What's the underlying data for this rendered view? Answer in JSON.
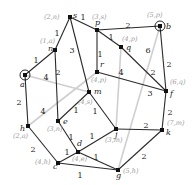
{
  "diagram": {
    "type": "weighted-graph-shortest-path",
    "nodes": [
      {
        "id": "s",
        "x": 70,
        "y": 17,
        "label": "(2,n)",
        "lx": 44,
        "ly": 19,
        "nx": 73,
        "ny": 18
      },
      {
        "id": "p",
        "x": 97,
        "y": 30,
        "label": "(3,s)",
        "lx": 92,
        "ly": 19,
        "nx": 95,
        "ny": 25
      },
      {
        "id": "b",
        "x": 160,
        "y": 26,
        "label": "(5,p)",
        "lx": 147,
        "ly": 17,
        "nx": 166,
        "ny": 29,
        "ring": true
      },
      {
        "id": "n",
        "x": 55,
        "y": 50,
        "label": "(1,a)",
        "lx": 40,
        "ly": 43,
        "nx": 48,
        "ny": 51
      },
      {
        "id": "q",
        "x": 121,
        "y": 47,
        "label": "(4,p)",
        "lx": 122,
        "ly": 41,
        "nx": 126,
        "ny": 50
      },
      {
        "id": "a",
        "x": 25,
        "y": 75,
        "label": "",
        "lx": 0,
        "ly": 0,
        "nx": 20,
        "ny": 87,
        "ring": true
      },
      {
        "id": "r",
        "x": 97,
        "y": 72,
        "label": "(4,p)",
        "lx": 91,
        "ly": 82,
        "nx": 100,
        "ny": 67
      },
      {
        "id": "m",
        "x": 89,
        "y": 92,
        "label": "(4,s)",
        "lx": 78,
        "ly": 104,
        "nx": 94,
        "ny": 94
      },
      {
        "id": "f",
        "x": 166,
        "y": 91,
        "label": "(6,q)",
        "lx": 170,
        "ly": 84,
        "nx": 170,
        "ny": 96
      },
      {
        "id": "e",
        "x": 58,
        "y": 121,
        "label": "(3,n)",
        "lx": 47,
        "ly": 131,
        "nx": 63,
        "ny": 124
      },
      {
        "id": "h",
        "x": 28,
        "y": 126,
        "label": "(2,a)",
        "lx": 13,
        "ly": 138,
        "nx": 20,
        "ny": 131
      },
      {
        "id": "j",
        "x": 116,
        "y": 129,
        "label": "(3,m)",
        "lx": 105,
        "ly": 142,
        "nx": 115,
        "ny": 137
      },
      {
        "id": "k",
        "x": 162,
        "y": 130,
        "label": "(7,m)",
        "lx": 167,
        "ly": 125,
        "nx": 166,
        "ny": 135
      },
      {
        "id": "d",
        "x": 78,
        "y": 152,
        "label": "(4,e)",
        "lx": 72,
        "ly": 161,
        "nx": 77,
        "ny": 146
      },
      {
        "id": "c",
        "x": 58,
        "y": 163,
        "label": "(4,h)",
        "lx": 35,
        "ly": 164,
        "nx": 53,
        "ny": 169
      },
      {
        "id": "g",
        "x": 118,
        "y": 170,
        "label": "(5,h)",
        "lx": 123,
        "ly": 173,
        "nx": 116,
        "ny": 178
      }
    ],
    "edges": [
      {
        "from": "s",
        "to": "p",
        "w": "1",
        "wx": 83,
        "wy": 17,
        "gray": false
      },
      {
        "from": "s",
        "to": "n",
        "w": "1",
        "wx": 57,
        "wy": 33,
        "gray": false
      },
      {
        "from": "s",
        "to": "m",
        "w": "3",
        "wx": 72,
        "wy": 50,
        "gray": false
      },
      {
        "from": "p",
        "to": "b",
        "w": "2",
        "wx": 128,
        "wy": 25,
        "gray": false
      },
      {
        "from": "p",
        "to": "q",
        "w": "1",
        "wx": 111,
        "wy": 37,
        "gray": false
      },
      {
        "from": "p",
        "to": "r",
        "w": "1",
        "wx": 100,
        "wy": 54,
        "gray": false
      },
      {
        "from": "q",
        "to": "f",
        "w": "2",
        "wx": 153,
        "wy": 72,
        "gray": false
      },
      {
        "from": "b",
        "to": "f",
        "w": "2",
        "wx": 169,
        "wy": 64,
        "gray": false
      },
      {
        "from": "r",
        "to": "f",
        "w": "3",
        "wx": 150,
        "wy": 93,
        "gray": false
      },
      {
        "from": "n",
        "to": "a",
        "w": "1",
        "wx": 36,
        "wy": 60,
        "gray": false
      },
      {
        "from": "n",
        "to": "e",
        "w": "2",
        "wx": 58,
        "wy": 72,
        "gray": false
      },
      {
        "from": "a",
        "to": "h",
        "w": "2",
        "wx": 19,
        "wy": 102,
        "gray": false
      },
      {
        "from": "m",
        "to": "e",
        "w": "1",
        "wx": 76,
        "wy": 110,
        "gray": false
      },
      {
        "from": "m",
        "to": "j",
        "w": "1",
        "wx": 95,
        "wy": 111,
        "gray": false
      },
      {
        "from": "e",
        "to": "d",
        "w": "1",
        "wx": 71,
        "wy": 137,
        "gray": false
      },
      {
        "from": "h",
        "to": "c",
        "w": "2",
        "wx": 33,
        "wy": 149,
        "gray": false
      },
      {
        "from": "d",
        "to": "j",
        "w": "1",
        "wx": 92,
        "wy": 136,
        "gray": false
      },
      {
        "from": "d",
        "to": "c",
        "w": "1",
        "wx": 67,
        "wy": 152,
        "gray": false
      },
      {
        "from": "d",
        "to": "g",
        "w": "1",
        "wx": 96,
        "wy": 157,
        "gray": false
      },
      {
        "from": "c",
        "to": "g",
        "w": "1",
        "wx": 80,
        "wy": 175,
        "gray": false
      },
      {
        "from": "j",
        "to": "k",
        "w": "2",
        "wx": 146,
        "wy": 125,
        "gray": false
      },
      {
        "from": "k",
        "to": "g",
        "w": "2",
        "wx": 144,
        "wy": 156,
        "gray": false
      },
      {
        "from": "f",
        "to": "k",
        "w": "2",
        "wx": 170,
        "wy": 112,
        "gray": false
      },
      {
        "from": "a",
        "to": "m",
        "w": "4",
        "wx": 46,
        "wy": 77,
        "gray": true
      },
      {
        "from": "h",
        "to": "r",
        "w": "4",
        "wx": 43,
        "wy": 111,
        "gray": true
      },
      {
        "from": "j",
        "to": "q",
        "w": "4",
        "wx": 121,
        "wy": 72,
        "gray": true
      },
      {
        "from": "g",
        "to": "b",
        "w": "6",
        "wx": 148,
        "wy": 50,
        "gray": true
      }
    ]
  }
}
